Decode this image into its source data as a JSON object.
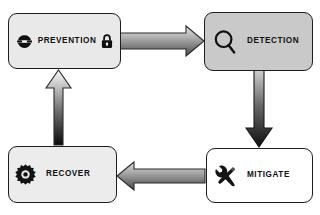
{
  "diagram": {
    "type": "cycle-flow",
    "background_color": "#ffffff",
    "nodes": [
      {
        "id": "prevention",
        "label": "PREVENTION",
        "fill_color": "#e9e9e9",
        "border_color": "#1d1d1d",
        "icons": [
          "security-cap-icon",
          "padlock-icon"
        ]
      },
      {
        "id": "detection",
        "label": "DETECTION",
        "fill_color": "#c9c9c9",
        "border_color": "#1d1d1d",
        "icons": [
          "magnifier-icon"
        ]
      },
      {
        "id": "mitigate",
        "label": "MITIGATE",
        "fill_color": "#ffffff",
        "border_color": "#1d1d1d",
        "icons": [
          "tools-icon"
        ]
      },
      {
        "id": "recover",
        "label": "RECOVER",
        "fill_color": "#ececec",
        "border_color": "#1d1d1d",
        "icons": [
          "gear-icon"
        ]
      }
    ],
    "arrows": [
      {
        "id": "prevention-to-detection",
        "from": "prevention",
        "to": "detection",
        "direction": "right",
        "fill_start": "#d6d6d6",
        "fill_end": "#4f4f4f"
      },
      {
        "id": "detection-to-mitigate",
        "from": "detection",
        "to": "mitigate",
        "direction": "down",
        "fill_start": "#c4c4c4",
        "fill_end": "#111111"
      },
      {
        "id": "mitigate-to-recover",
        "from": "mitigate",
        "to": "recover",
        "direction": "left",
        "fill_start": "#cfcfcf",
        "fill_end": "#4a4a4a"
      },
      {
        "id": "recover-to-prevention",
        "from": "recover",
        "to": "prevention",
        "direction": "up",
        "fill_start": "#0d0d0d",
        "fill_end": "#ffffff"
      }
    ]
  }
}
